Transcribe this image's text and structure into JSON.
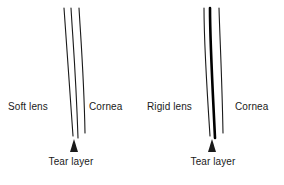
{
  "figure": {
    "background_color": "#ffffff",
    "stroke_color": "#1a1a1a",
    "panels": [
      {
        "id": "soft-lens-panel",
        "lens_label": "Soft lens",
        "cornea_label": "Cornea",
        "tear_label": "Tear layer",
        "lens_line_weight": "thin",
        "line_count": 3,
        "marker": "triangle-up"
      },
      {
        "id": "rigid-lens-panel",
        "lens_label": "Rigid lens",
        "cornea_label": "Cornea",
        "tear_label": "Tear layer",
        "lens_line_weight": "thick",
        "line_count": 3,
        "marker": "triangle-up"
      }
    ]
  }
}
